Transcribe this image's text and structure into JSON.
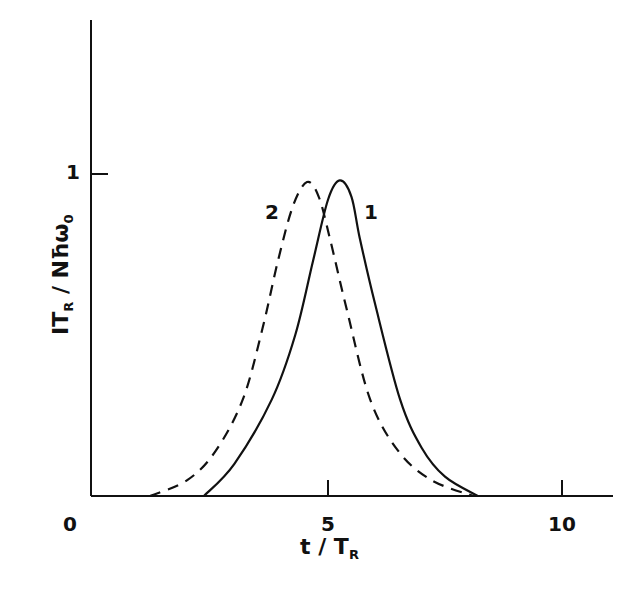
{
  "chart_data": {
    "type": "line",
    "title": "",
    "xlabel": "t / T_R",
    "ylabel": "I T_R / N ħ ω_0",
    "xlim": [
      0,
      11.2
    ],
    "ylim": [
      0,
      1.4
    ],
    "x_ticks": [
      0,
      5,
      10
    ],
    "y_ticks": [
      1
    ],
    "grid": false,
    "legend": "inline curve labels",
    "series": [
      {
        "name": "1",
        "style": "solid",
        "x": [
          2.35,
          3.0,
          3.8,
          4.3,
          4.68,
          5.0,
          5.25,
          5.5,
          5.68,
          6.0,
          6.54,
          7.0,
          7.5,
          8.2
        ],
        "y": [
          0.0,
          0.1,
          0.3,
          0.5,
          0.73,
          0.92,
          0.98,
          0.93,
          0.8,
          0.6,
          0.3,
          0.15,
          0.06,
          0.0
        ]
      },
      {
        "name": "2",
        "style": "dashed",
        "x": [
          1.2,
          2.0,
          2.6,
          3.18,
          3.6,
          3.93,
          4.25,
          4.55,
          4.8,
          5.04,
          5.4,
          5.9,
          6.5,
          7.2,
          8.1
        ],
        "y": [
          0.0,
          0.05,
          0.14,
          0.3,
          0.52,
          0.73,
          0.9,
          0.975,
          0.93,
          0.8,
          0.58,
          0.3,
          0.14,
          0.05,
          0.0
        ]
      }
    ],
    "annotations": [
      {
        "text": "1",
        "x": 5.8,
        "y": 0.88
      },
      {
        "text": "2",
        "x": 3.8,
        "y": 0.88
      }
    ]
  },
  "labels": {
    "x_tick_0": "0",
    "x_tick_5": "5",
    "x_tick_10": "10",
    "y_tick_1": "1",
    "curve_1": "1",
    "curve_2": "2",
    "xlabel_main": "t / T",
    "xlabel_sub": "R",
    "ylabel_pre": "IT",
    "ylabel_sub": "R",
    "ylabel_post": " / Nħω",
    "ylabel_sub2": "0"
  }
}
